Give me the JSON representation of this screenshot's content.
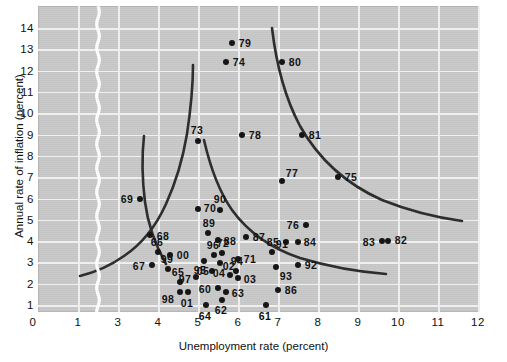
{
  "chart_data": {
    "type": "scatter",
    "title": "",
    "xlabel": "Unemployment rate (percent)",
    "ylabel": "Annual rate of inflation (percent)",
    "xlim": [
      0,
      12.6
    ],
    "ylim": [
      0,
      14.6
    ],
    "x_ticks": [
      0,
      1,
      3,
      4,
      5,
      6,
      7,
      8,
      9,
      10,
      11,
      12
    ],
    "y_ticks": [
      1,
      2,
      3,
      4,
      5,
      6,
      7,
      8,
      9,
      10,
      11,
      12,
      13,
      14
    ],
    "axis_break": {
      "between": [
        1,
        3
      ],
      "style": "wavy-white-band"
    },
    "grid": true,
    "legend": "none",
    "plot_background": "#c9c9c9",
    "gridline_color": "#f2f2f2",
    "point_color": "#111111",
    "curve_color": "#2a2a2a",
    "points": [
      {
        "label": "61",
        "x": 6.7,
        "y": 1.0,
        "label_dx": -1,
        "label_dy": 11
      },
      {
        "label": "62",
        "x": 5.6,
        "y": 1.25,
        "label_dx": -1,
        "label_dy": 10
      },
      {
        "label": "63",
        "x": 5.7,
        "y": 1.6,
        "label_dx": 12,
        "label_dy": 1
      },
      {
        "label": "64",
        "x": 5.2,
        "y": 1.0,
        "label_dx": -1,
        "label_dy": 11
      },
      {
        "label": "65",
        "x": 4.55,
        "y": 2.1,
        "label_dx": -2,
        "label_dy": -10
      },
      {
        "label": "66",
        "x": 4.0,
        "y": 3.5,
        "label_dx": -1,
        "label_dy": -10
      },
      {
        "label": "67",
        "x": 3.85,
        "y": 2.9,
        "label_dx": -13,
        "label_dy": 1
      },
      {
        "label": "68",
        "x": 3.8,
        "y": 4.3,
        "label_dx": 13,
        "label_dy": 1
      },
      {
        "label": "69",
        "x": 3.55,
        "y": 6.0,
        "label_dx": -13,
        "label_dy": 0
      },
      {
        "label": "70",
        "x": 5.0,
        "y": 5.5,
        "label_dx": 12,
        "label_dy": -1
      },
      {
        "label": "71",
        "x": 6.0,
        "y": 3.15,
        "label_dx": 12,
        "label_dy": 0
      },
      {
        "label": "72",
        "x": 5.6,
        "y": 3.45,
        "label_dx": 1,
        "label_dy": -10
      },
      {
        "label": "73",
        "x": 5.0,
        "y": 8.7,
        "label_dx": -1,
        "label_dy": -11
      },
      {
        "label": "74",
        "x": 5.7,
        "y": 12.4,
        "label_dx": 13,
        "label_dy": 0
      },
      {
        "label": "75",
        "x": 8.5,
        "y": 7.0,
        "label_dx": 13,
        "label_dy": 0
      },
      {
        "label": "76",
        "x": 7.7,
        "y": 4.75,
        "label_dx": -13,
        "label_dy": 0
      },
      {
        "label": "77",
        "x": 7.1,
        "y": 6.8,
        "label_dx": 10,
        "label_dy": -8
      },
      {
        "label": "78",
        "x": 6.1,
        "y": 9.0,
        "label_dx": 13,
        "label_dy": 0
      },
      {
        "label": "79",
        "x": 5.85,
        "y": 13.3,
        "label_dx": 13,
        "label_dy": 0
      },
      {
        "label": "80",
        "x": 7.1,
        "y": 12.4,
        "label_dx": 13,
        "label_dy": 0
      },
      {
        "label": "81",
        "x": 7.6,
        "y": 9.0,
        "label_dx": 13,
        "label_dy": 0
      },
      {
        "label": "82",
        "x": 9.75,
        "y": 4.0,
        "label_dx": 13,
        "label_dy": -1
      },
      {
        "label": "83",
        "x": 9.6,
        "y": 4.0,
        "label_dx": -13,
        "label_dy": 1
      },
      {
        "label": "84",
        "x": 7.5,
        "y": 3.95,
        "label_dx": 12,
        "label_dy": 0
      },
      {
        "label": "85",
        "x": 7.2,
        "y": 3.95,
        "label_dx": -13,
        "label_dy": 0
      },
      {
        "label": "86",
        "x": 7.0,
        "y": 1.7,
        "label_dx": 13,
        "label_dy": 0
      },
      {
        "label": "87",
        "x": 6.2,
        "y": 4.2,
        "label_dx": 13,
        "label_dy": 0
      },
      {
        "label": "88",
        "x": 5.5,
        "y": 4.05,
        "label_dx": 12,
        "label_dy": 1
      },
      {
        "label": "89",
        "x": 5.25,
        "y": 4.4,
        "label_dx": 1,
        "label_dy": -10
      },
      {
        "label": "90",
        "x": 5.55,
        "y": 5.45,
        "label_dx": 0,
        "label_dy": -11
      },
      {
        "label": "91",
        "x": 6.85,
        "y": 3.5,
        "label_dx": 10,
        "label_dy": -8
      },
      {
        "label": "92",
        "x": 7.5,
        "y": 2.9,
        "label_dx": 13,
        "label_dy": 0
      },
      {
        "label": "93",
        "x": 6.95,
        "y": 2.8,
        "label_dx": 10,
        "label_dy": 9
      },
      {
        "label": "94",
        "x": 5.95,
        "y": 2.6,
        "label_dx": 1,
        "label_dy": -10
      },
      {
        "label": "95",
        "x": 5.35,
        "y": 2.6,
        "label_dx": -12,
        "label_dy": -1
      },
      {
        "label": "96",
        "x": 5.4,
        "y": 3.35,
        "label_dx": -1,
        "label_dy": -10
      },
      {
        "label": "97",
        "x": 4.95,
        "y": 2.3,
        "label_dx": -11,
        "label_dy": 2
      },
      {
        "label": "98",
        "x": 4.55,
        "y": 1.6,
        "label_dx": -12,
        "label_dy": 7
      },
      {
        "label": "99",
        "x": 4.25,
        "y": 2.7,
        "label_dx": -1,
        "label_dy": -10
      },
      {
        "label": "00",
        "x": 4.3,
        "y": 3.35,
        "label_dx": 13,
        "label_dy": 0
      },
      {
        "label": "01",
        "x": 4.75,
        "y": 1.6,
        "label_dx": -1,
        "label_dy": 11
      },
      {
        "label": "02",
        "x": 5.8,
        "y": 2.4,
        "label_dx": -1,
        "label_dy": -9
      },
      {
        "label": "03",
        "x": 6.0,
        "y": 2.25,
        "label_dx": 12,
        "label_dy": 1
      },
      {
        "label": "04",
        "x": 5.55,
        "y": 2.95,
        "label_dx": -1,
        "label_dy": 10
      },
      {
        "label": "05",
        "x": 5.15,
        "y": 3.05,
        "label_dx": -1,
        "label_dy": 10
      },
      {
        "label": "60",
        "x": 5.5,
        "y": 1.8,
        "label_dx": -13,
        "label_dy": 1
      }
    ],
    "curves": [
      {
        "name": "phillips-curve-1960s",
        "path": "M 155,59 C 155,82 152,108 149,128 C 145,152 138,176 128,198 C 118,220 104,238 86,250 C 72,260 58,266 42,270",
        "description": "lowest short-run Phillips curve through 1961-1969 and 1986-2005 observations"
      },
      {
        "name": "phillips-curve-1970s",
        "path": "M 128,258 C 118,240 110,220 107,196 C 104,172 104,148 106,130",
        "description": "steep left-hand curve through 1966-1969"
      },
      {
        "name": "phillips-curve-mid",
        "path": "M 166,134 C 172,160 180,184 194,204 C 210,226 232,242 262,252 C 292,261 322,266 348,268",
        "description": "middle curve through 1973, 1988-1996 region"
      },
      {
        "name": "phillips-curve-1970s-high",
        "path": "M 234,22 C 238,56 246,90 262,120 C 280,152 308,178 344,194 C 374,206 402,212 424,215",
        "description": "upper right curve through 1974, 1978, 1977, 1982-83"
      }
    ]
  },
  "axes": {
    "x_tick_labels": [
      "0",
      "1",
      "3",
      "4",
      "5",
      "6",
      "7",
      "8",
      "9",
      "10",
      "11",
      "12"
    ],
    "y_tick_labels": [
      "1",
      "2",
      "3",
      "4",
      "5",
      "6",
      "7",
      "8",
      "9",
      "10",
      "11",
      "12",
      "13",
      "14"
    ],
    "x_title": "Unemployment rate (percent)",
    "y_title": "Annual rate of inflation (percent)"
  }
}
